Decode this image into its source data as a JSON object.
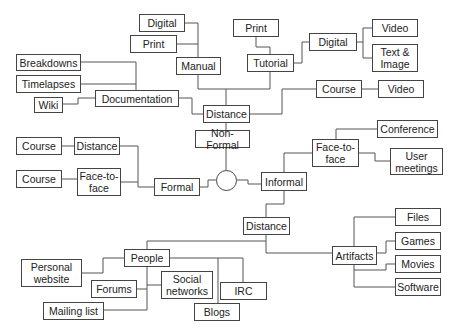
{
  "diagram": {
    "type": "tree",
    "root": "hub",
    "nodes": [
      {
        "id": "hub",
        "label": "",
        "shape": "circle",
        "x": 216,
        "y": 170,
        "w": 21,
        "h": 21
      },
      {
        "id": "non_formal",
        "label": "Non-Formal",
        "x": 195,
        "y": 130,
        "w": 55,
        "h": 18
      },
      {
        "id": "distance_nf",
        "label": "Distance",
        "x": 203,
        "y": 105,
        "w": 47,
        "h": 18
      },
      {
        "id": "manual",
        "label": "Manual",
        "x": 176,
        "y": 57,
        "w": 45,
        "h": 18
      },
      {
        "id": "digital_manual",
        "label": "Digital",
        "x": 139,
        "y": 14,
        "w": 46,
        "h": 18
      },
      {
        "id": "print_manual",
        "label": "Print",
        "x": 130,
        "y": 35,
        "w": 47,
        "h": 18
      },
      {
        "id": "documentation",
        "label": "Documentation",
        "x": 95,
        "y": 90,
        "w": 84,
        "h": 17
      },
      {
        "id": "breakdowns",
        "label": "Breakdowns",
        "x": 16,
        "y": 54,
        "w": 65,
        "h": 17
      },
      {
        "id": "timelapses",
        "label": "Timelapses",
        "x": 16,
        "y": 75,
        "w": 65,
        "h": 18
      },
      {
        "id": "wiki",
        "label": "Wiki",
        "x": 34,
        "y": 97,
        "w": 29,
        "h": 16
      },
      {
        "id": "tutorial",
        "label": "Tutorial",
        "x": 247,
        "y": 54,
        "w": 47,
        "h": 18
      },
      {
        "id": "print_tutorial",
        "label": "Print",
        "x": 233,
        "y": 19,
        "w": 46,
        "h": 18
      },
      {
        "id": "digital_tutorial",
        "label": "Digital",
        "x": 309,
        "y": 33,
        "w": 48,
        "h": 18
      },
      {
        "id": "video_digital",
        "label": "Video",
        "x": 372,
        "y": 19,
        "w": 46,
        "h": 18
      },
      {
        "id": "text_image",
        "label": "Text &\nImage",
        "x": 372,
        "y": 44,
        "w": 46,
        "h": 28
      },
      {
        "id": "course_nf",
        "label": "Course",
        "x": 316,
        "y": 80,
        "w": 46,
        "h": 18
      },
      {
        "id": "video_course",
        "label": "Video",
        "x": 378,
        "y": 80,
        "w": 46,
        "h": 18
      },
      {
        "id": "formal",
        "label": "Formal",
        "x": 154,
        "y": 178,
        "w": 46,
        "h": 18
      },
      {
        "id": "distance_formal",
        "label": "Distance",
        "x": 74,
        "y": 137,
        "w": 46,
        "h": 18
      },
      {
        "id": "course_f1",
        "label": "Course",
        "x": 16,
        "y": 137,
        "w": 46,
        "h": 18
      },
      {
        "id": "face_formal",
        "label": "Face-to-\nface",
        "x": 77,
        "y": 168,
        "w": 44,
        "h": 28
      },
      {
        "id": "course_f2",
        "label": "Course",
        "x": 16,
        "y": 170,
        "w": 46,
        "h": 18
      },
      {
        "id": "informal",
        "label": "Informal",
        "x": 261,
        "y": 172,
        "w": 46,
        "h": 19
      },
      {
        "id": "face_informal",
        "label": "Face-to-\nface",
        "x": 312,
        "y": 139,
        "w": 47,
        "h": 28
      },
      {
        "id": "conference",
        "label": "Conference",
        "x": 377,
        "y": 120,
        "w": 61,
        "h": 18
      },
      {
        "id": "user_meetings",
        "label": "User\nmeetings",
        "x": 390,
        "y": 148,
        "w": 53,
        "h": 27
      },
      {
        "id": "distance_informal",
        "label": "Distance",
        "x": 243,
        "y": 217,
        "w": 47,
        "h": 18
      },
      {
        "id": "artifacts",
        "label": "Artifacts",
        "x": 332,
        "y": 246,
        "w": 45,
        "h": 19
      },
      {
        "id": "files",
        "label": "Files",
        "x": 395,
        "y": 208,
        "w": 46,
        "h": 18
      },
      {
        "id": "games",
        "label": "Games",
        "x": 395,
        "y": 232,
        "w": 46,
        "h": 18
      },
      {
        "id": "movies",
        "label": "Movies",
        "x": 395,
        "y": 255,
        "w": 46,
        "h": 18
      },
      {
        "id": "software",
        "label": "Software",
        "x": 395,
        "y": 278,
        "w": 46,
        "h": 18
      },
      {
        "id": "people",
        "label": "People",
        "x": 124,
        "y": 249,
        "w": 46,
        "h": 18
      },
      {
        "id": "personal_website",
        "label": "Personal\nwebsite",
        "x": 21,
        "y": 259,
        "w": 61,
        "h": 28
      },
      {
        "id": "forums",
        "label": "Forums",
        "x": 91,
        "y": 280,
        "w": 46,
        "h": 18
      },
      {
        "id": "social_networks",
        "label": "Social\nnetworks",
        "x": 161,
        "y": 271,
        "w": 52,
        "h": 28
      },
      {
        "id": "irc",
        "label": "IRC",
        "x": 220,
        "y": 282,
        "w": 47,
        "h": 18
      },
      {
        "id": "mailing_list",
        "label": "Mailing list",
        "x": 43,
        "y": 302,
        "w": 61,
        "h": 18
      },
      {
        "id": "blogs",
        "label": "Blogs",
        "x": 194,
        "y": 303,
        "w": 46,
        "h": 18
      }
    ],
    "edges": [
      {
        "from": "hub",
        "to": "non_formal",
        "path": "M226,170 L226,148"
      },
      {
        "from": "non_formal",
        "to": "distance_nf",
        "path": "M226,130 L226,123"
      },
      {
        "from": "distance_nf",
        "to": "manual",
        "path": "M226,105 L226,89 L198,89 L198,75"
      },
      {
        "from": "manual",
        "to": "digital_manual",
        "path": "M198,57 L198,23 L185,23"
      },
      {
        "from": "manual",
        "to": "print_manual",
        "path": "M198,44 L177,44"
      },
      {
        "from": "distance_nf",
        "to": "documentation",
        "path": "M203,114 L192,114 L192,98 L179,98"
      },
      {
        "from": "documentation",
        "to": "breakdowns",
        "path": "M136,90 L136,62 L81,62"
      },
      {
        "from": "documentation",
        "to": "timelapses",
        "path": "M136,84 L81,84"
      },
      {
        "from": "documentation",
        "to": "wiki",
        "path": "M95,98 L78,98 L78,104 L63,104"
      },
      {
        "from": "distance_nf",
        "to": "tutorial",
        "path": "M226,89 L270,89 L270,72"
      },
      {
        "from": "tutorial",
        "to": "print_tutorial",
        "path": "M270,54 L270,47 L256,47 L256,37"
      },
      {
        "from": "tutorial",
        "to": "digital_tutorial",
        "path": "M294,63 L302,63 L302,42 L309,42"
      },
      {
        "from": "digital_tutorial",
        "to": "video_digital",
        "path": "M357,42 L363,42 L363,28 L372,28"
      },
      {
        "from": "digital_tutorial",
        "to": "text_image",
        "path": "M363,42 L363,58 L372,58"
      },
      {
        "from": "distance_nf",
        "to": "course_nf",
        "path": "M250,114 L282,114 L282,89 L316,89"
      },
      {
        "from": "course_nf",
        "to": "video_course",
        "path": "M362,89 L378,89"
      },
      {
        "from": "hub",
        "to": "formal",
        "path": "M216,180 L208,180 L208,187 L200,187"
      },
      {
        "from": "formal",
        "to": "distance_formal",
        "path": "M154,187 L138,187 L138,146 L120,146"
      },
      {
        "from": "formal",
        "to": "face_formal",
        "path": "M138,182 L121,182"
      },
      {
        "from": "distance_formal",
        "to": "course_f1",
        "path": "M74,146 L62,146"
      },
      {
        "from": "face_formal",
        "to": "course_f2",
        "path": "M77,179 L62,179"
      },
      {
        "from": "hub",
        "to": "informal",
        "path": "M237,180 L248,180 L248,184 L261,184"
      },
      {
        "from": "informal",
        "to": "face_informal",
        "path": "M284,172 L284,153 L312,153"
      },
      {
        "from": "face_informal",
        "to": "conference",
        "path": "M336,139 L336,129 L377,129"
      },
      {
        "from": "face_informal",
        "to": "user_meetings",
        "path": "M359,153 L375,153 L375,161 L390,161"
      },
      {
        "from": "informal",
        "to": "distance_informal",
        "path": "M284,191 L284,204 L266,204 L266,217"
      },
      {
        "from": "distance_informal",
        "to": "artifacts",
        "path": "M266,235 L266,253 L332,253"
      },
      {
        "from": "artifacts",
        "to": "files",
        "path": "M354,246 L354,217 L395,217"
      },
      {
        "from": "artifacts",
        "to": "games",
        "path": "M377,253 L386,253 L386,241 L395,241"
      },
      {
        "from": "artifacts",
        "to": "movies",
        "path": "M354,265 L354,270 L386,270 L386,264 L395,264"
      },
      {
        "from": "artifacts",
        "to": "software",
        "path": "M354,270 L354,287 L395,287"
      },
      {
        "from": "distance_informal",
        "to": "people",
        "path": "M266,241 L147,241 L147,249"
      },
      {
        "from": "people",
        "to": "personal_website",
        "path": "M124,258 L103,258 L103,273 L82,273"
      },
      {
        "from": "people",
        "to": "forums",
        "path": "M147,267 L147,310"
      },
      {
        "from": "people",
        "to": "forums_link",
        "path": "M137,289 L147,289"
      },
      {
        "from": "people",
        "to": "social_networks",
        "path": "M147,285 L161,285"
      },
      {
        "from": "people",
        "to": "mailing_list",
        "path": "M147,310 L104,310"
      },
      {
        "from": "people",
        "to": "blogs",
        "path": "M170,258 L218,258 L218,303"
      },
      {
        "from": "people",
        "to": "irc",
        "path": "M218,258 L243,258 L243,282"
      }
    ]
  }
}
